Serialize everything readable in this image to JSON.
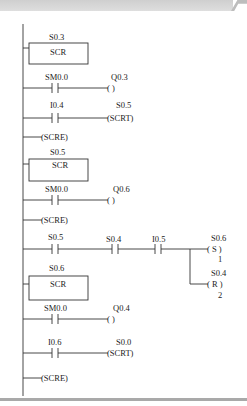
{
  "rungs": [
    {
      "type": "scr_box",
      "operand": "S0.3",
      "label": "SCR"
    },
    {
      "type": "contact_coil",
      "contact": "SM0.0",
      "coil": "Q0.3",
      "coil_label": "(      )"
    },
    {
      "type": "contact_coil",
      "contact": "I0.4",
      "coil": "S0.5",
      "coil_label": "(SCRT)"
    },
    {
      "type": "scre",
      "label": "(SCRE)"
    },
    {
      "type": "scr_box",
      "operand": "S0.5",
      "label": "SCR"
    },
    {
      "type": "contact_coil",
      "contact": "SM0.0",
      "coil": "Q0.6",
      "coil_label": "(      )"
    },
    {
      "type": "scre",
      "label": "(SCRE)"
    },
    {
      "type": "branch",
      "contacts": [
        "S0.5",
        "S0.4",
        "I0.5"
      ],
      "coils": [
        {
          "operand": "S0.6",
          "label": "( S )",
          "count": "1"
        },
        {
          "operand": "S0.4",
          "label": "( R )",
          "count": "2"
        }
      ]
    },
    {
      "type": "scr_box",
      "operand": "S0.6",
      "label": "SCR"
    },
    {
      "type": "contact_coil",
      "contact": "SM0.0",
      "coil": "Q0.4",
      "coil_label": "(      )"
    },
    {
      "type": "contact_coil",
      "contact": "I0.6",
      "coil": "S0.0",
      "coil_label": "(SCRT)"
    },
    {
      "type": "scre",
      "label": "(SCRE)"
    }
  ]
}
